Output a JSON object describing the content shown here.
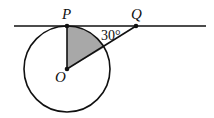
{
  "diagram": {
    "points": {
      "P": "P",
      "Q": "Q",
      "O": "O"
    },
    "angle_label": "30°",
    "colors": {
      "stroke": "#111111",
      "shade": "#a8a8a8"
    }
  }
}
